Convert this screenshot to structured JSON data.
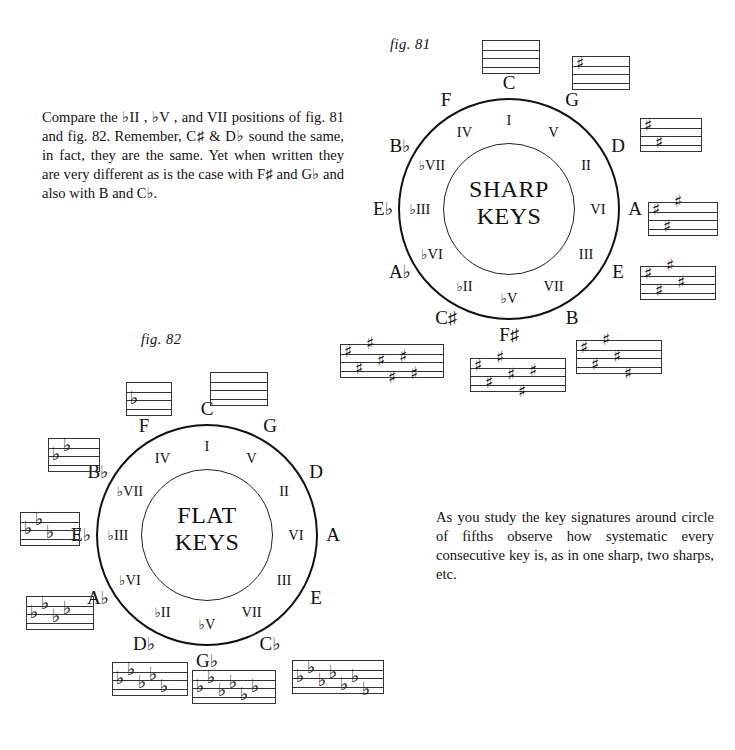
{
  "document": {
    "title": "Circle of Fifths — Sharp Keys and Flat Keys"
  },
  "intro_paragraph": "Compare the ♭II , ♭V , and VII positions of fig. 81 and fig. 82. Remember, C♯ & D♭ sound the same, in fact, they are the same. Yet when written they are very different as is the case with F♯ and G♭ and also with B and C♭.",
  "study_paragraph": "As you study the key signatures around circle of fifths observe how systematic every consecutive key is, as in one sharp, two sharps, etc.",
  "figures": [
    {
      "id": "fig81",
      "caption": "fig. 81",
      "wheel_title": "SHARP\nKEYS",
      "outer_keys": [
        {
          "name": "C",
          "angle": 0
        },
        {
          "name": "G",
          "angle": 30
        },
        {
          "name": "D",
          "angle": 60
        },
        {
          "name": "A",
          "angle": 90
        },
        {
          "name": "E",
          "angle": 120
        },
        {
          "name": "B",
          "angle": 150
        },
        {
          "name": "F♯",
          "angle": 180
        },
        {
          "name": "C♯",
          "angle": 210
        },
        {
          "name": "A♭",
          "angle": 240
        },
        {
          "name": "E♭",
          "angle": 270
        },
        {
          "name": "B♭",
          "angle": 300
        },
        {
          "name": "F",
          "angle": 330
        }
      ],
      "degrees": [
        {
          "name": "I",
          "angle": 0
        },
        {
          "name": "V",
          "angle": 30
        },
        {
          "name": "II",
          "angle": 60
        },
        {
          "name": "VI",
          "angle": 90
        },
        {
          "name": "III",
          "angle": 120
        },
        {
          "name": "VII",
          "angle": 150
        },
        {
          "name": "♭V",
          "angle": 180
        },
        {
          "name": "♭II",
          "angle": 210
        },
        {
          "name": "♭VI",
          "angle": 240
        },
        {
          "name": "♭III",
          "angle": 270
        },
        {
          "name": "♭VII",
          "angle": 300
        },
        {
          "name": "IV",
          "angle": 330
        }
      ],
      "key_signatures": [
        {
          "key": "C",
          "accidental_type": "none",
          "count": 0
        },
        {
          "key": "G",
          "accidental_type": "sharp",
          "count": 1
        },
        {
          "key": "D",
          "accidental_type": "sharp",
          "count": 2
        },
        {
          "key": "A",
          "accidental_type": "sharp",
          "count": 3
        },
        {
          "key": "E",
          "accidental_type": "sharp",
          "count": 4
        },
        {
          "key": "B",
          "accidental_type": "sharp",
          "count": 5
        },
        {
          "key": "F♯",
          "accidental_type": "sharp",
          "count": 6
        },
        {
          "key": "C♯",
          "accidental_type": "sharp",
          "count": 7
        }
      ]
    },
    {
      "id": "fig82",
      "caption": "fig. 82",
      "wheel_title": "FLAT\nKEYS",
      "outer_keys": [
        {
          "name": "C",
          "angle": 0
        },
        {
          "name": "G",
          "angle": 30
        },
        {
          "name": "D",
          "angle": 60
        },
        {
          "name": "A",
          "angle": 90
        },
        {
          "name": "E",
          "angle": 120
        },
        {
          "name": "C♭",
          "angle": 150
        },
        {
          "name": "G♭",
          "angle": 180
        },
        {
          "name": "D♭",
          "angle": 210
        },
        {
          "name": "A♭",
          "angle": 240
        },
        {
          "name": "E♭",
          "angle": 270
        },
        {
          "name": "B♭",
          "angle": 300
        },
        {
          "name": "F",
          "angle": 330
        }
      ],
      "degrees": [
        {
          "name": "I",
          "angle": 0
        },
        {
          "name": "V",
          "angle": 30
        },
        {
          "name": "II",
          "angle": 60
        },
        {
          "name": "VI",
          "angle": 90
        },
        {
          "name": "III",
          "angle": 120
        },
        {
          "name": "VII",
          "angle": 150
        },
        {
          "name": "♭V",
          "angle": 180
        },
        {
          "name": "♭II",
          "angle": 210
        },
        {
          "name": "♭VI",
          "angle": 240
        },
        {
          "name": "♭III",
          "angle": 270
        },
        {
          "name": "♭VII",
          "angle": 300
        },
        {
          "name": "IV",
          "angle": 330
        }
      ],
      "key_signatures": [
        {
          "key": "C",
          "accidental_type": "none",
          "count": 0
        },
        {
          "key": "F",
          "accidental_type": "flat",
          "count": 1
        },
        {
          "key": "B♭",
          "accidental_type": "flat",
          "count": 2
        },
        {
          "key": "E♭",
          "accidental_type": "flat",
          "count": 3
        },
        {
          "key": "A♭",
          "accidental_type": "flat",
          "count": 4
        },
        {
          "key": "D♭",
          "accidental_type": "flat",
          "count": 5
        },
        {
          "key": "G♭",
          "accidental_type": "flat",
          "count": 6
        },
        {
          "key": "C♭",
          "accidental_type": "flat",
          "count": 7
        }
      ]
    }
  ],
  "glyphs": {
    "sharp": "♯",
    "flat": "♭"
  },
  "colors": {
    "ink": "#111111",
    "staff_line": "#333333",
    "background": "#ffffff"
  },
  "staff_placements": {
    "fig81": [
      {
        "key": "C",
        "x": 482,
        "y": 40,
        "w": 58,
        "h": 34,
        "label_x": null,
        "label_y": null
      },
      {
        "key": "G",
        "x": 572,
        "y": 56,
        "w": 58,
        "h": 34,
        "label_x": null,
        "label_y": null
      },
      {
        "key": "D",
        "x": 640,
        "y": 118,
        "w": 62,
        "h": 34,
        "label_x": null,
        "label_y": null
      },
      {
        "key": "A",
        "x": 648,
        "y": 202,
        "w": 70,
        "h": 34,
        "label_x": null,
        "label_y": null
      },
      {
        "key": "E",
        "x": 640,
        "y": 266,
        "w": 76,
        "h": 34,
        "label_x": null,
        "label_y": null
      },
      {
        "key": "B",
        "x": 576,
        "y": 340,
        "w": 86,
        "h": 34,
        "label_x": null,
        "label_y": null
      },
      {
        "key": "F♯",
        "x": 470,
        "y": 358,
        "w": 96,
        "h": 34,
        "label_x": null,
        "label_y": null
      },
      {
        "key": "C♯",
        "x": 340,
        "y": 344,
        "w": 104,
        "h": 34,
        "label_x": null,
        "label_y": null
      }
    ],
    "fig82": [
      {
        "key": "C",
        "x": 210,
        "y": 372,
        "w": 58,
        "h": 34
      },
      {
        "key": "F",
        "x": 126,
        "y": 382,
        "w": 46,
        "h": 34
      },
      {
        "key": "B♭",
        "x": 48,
        "y": 438,
        "w": 52,
        "h": 34
      },
      {
        "key": "E♭",
        "x": 20,
        "y": 512,
        "w": 60,
        "h": 34
      },
      {
        "key": "A♭",
        "x": 26,
        "y": 596,
        "w": 68,
        "h": 34
      },
      {
        "key": "D♭",
        "x": 112,
        "y": 662,
        "w": 76,
        "h": 34
      },
      {
        "key": "G♭",
        "x": 192,
        "y": 670,
        "w": 84,
        "h": 34
      },
      {
        "key": "C♭",
        "x": 292,
        "y": 660,
        "w": 92,
        "h": 34
      }
    ]
  }
}
